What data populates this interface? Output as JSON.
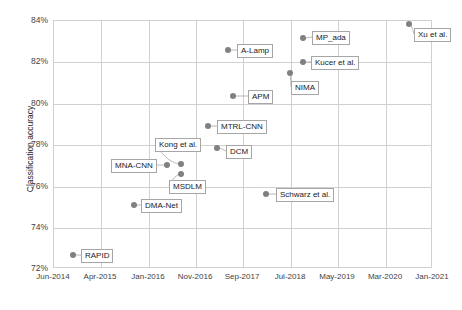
{
  "chart_data": {
    "type": "scatter",
    "title": "",
    "xlabel": "",
    "ylabel": "Classification accuracy",
    "xtick_labels": [
      "Jun-2014",
      "Apr-2015",
      "Jan-2016",
      "Nov-2016",
      "Sep-2017",
      "Jul-2018",
      "May-2019",
      "Mar-2020",
      "Jan-2021"
    ],
    "ytick_labels": [
      "84%",
      "82%",
      "80%",
      "78%",
      "76%",
      "74%",
      "72%"
    ],
    "ylim": [
      72,
      84
    ],
    "ytick_values": [
      84,
      82,
      80,
      78,
      76,
      74,
      72
    ],
    "grid": true,
    "legend": "none",
    "marker_color": "#808080",
    "points": [
      {
        "label": "RAPID",
        "x_pct": 5.3,
        "y": 72.85,
        "date": "Oct-2014"
      },
      {
        "label": "DMA-Net",
        "x_pct": 21.4,
        "y": 75.3,
        "date": "Mar-2016"
      },
      {
        "label": "MNA-CNN",
        "x_pct": 30.1,
        "y": 77.25,
        "date": "Jan-2017"
      },
      {
        "label": "Kong et al.",
        "x_pct": 33.8,
        "y": 77.3,
        "date": "May-2017"
      },
      {
        "label": "MSDLM",
        "x_pct": 33.8,
        "y": 76.8,
        "date": "May-2017"
      },
      {
        "label": "MTRL-CNN",
        "x_pct": 40.9,
        "y": 79.15,
        "date": "Dec-2017"
      },
      {
        "label": "DCM",
        "x_pct": 43.3,
        "y": 78.05,
        "date": "Mar-2018"
      },
      {
        "label": "A-Lamp",
        "x_pct": 46.2,
        "y": 82.8,
        "date": "Jun-2018"
      },
      {
        "label": "APM",
        "x_pct": 47.5,
        "y": 80.55,
        "date": "Jul-2018"
      },
      {
        "label": "Schwarz et al.",
        "x_pct": 56.2,
        "y": 75.8,
        "date": "Apr-2019"
      },
      {
        "label": "NIMA",
        "x_pct": 62.5,
        "y": 81.65,
        "date": "Nov-2019"
      },
      {
        "label": "Kucer et al.",
        "x_pct": 65.9,
        "y": 82.2,
        "date": "Mar-2020"
      },
      {
        "label": "MP_ada",
        "x_pct": 65.9,
        "y": 83.35,
        "date": "Mar-2020"
      },
      {
        "label": "Xu et al.",
        "x_pct": 93.9,
        "y": 84.0,
        "date": "Dec-2020"
      }
    ],
    "markers": [
      {
        "name": "rapid",
        "cx": 73,
        "cy": 255
      },
      {
        "name": "dma-net",
        "cx": 134,
        "cy": 205
      },
      {
        "name": "mna-cnn",
        "cx": 167,
        "cy": 165
      },
      {
        "name": "kong-et-al",
        "cx": 181,
        "cy": 164
      },
      {
        "name": "msdlm",
        "cx": 181,
        "cy": 174
      },
      {
        "name": "mtrl-cnn",
        "cx": 208,
        "cy": 126
      },
      {
        "name": "dcm",
        "cx": 217,
        "cy": 148
      },
      {
        "name": "a-lamp",
        "cx": 228,
        "cy": 50
      },
      {
        "name": "apm",
        "cx": 233,
        "cy": 96
      },
      {
        "name": "schwarz-et-al",
        "cx": 266,
        "cy": 194
      },
      {
        "name": "nima",
        "cx": 290,
        "cy": 73
      },
      {
        "name": "kucer-et-al",
        "cx": 303,
        "cy": 62
      },
      {
        "name": "mp-ada",
        "cx": 303,
        "cy": 38
      },
      {
        "name": "xu-et-al",
        "cx": 409,
        "cy": 24
      }
    ],
    "labels": [
      {
        "name": "rapid",
        "text": "RAPID",
        "left": 81,
        "top": 249
      },
      {
        "name": "dma-net",
        "text": "DMA-Net",
        "left": 141,
        "top": 199
      },
      {
        "name": "mna-cnn",
        "text": "MNA-CNN",
        "left": 111,
        "top": 159
      },
      {
        "name": "kong-et-al",
        "text": "Kong et al.",
        "left": 155,
        "top": 138
      },
      {
        "name": "msdlm",
        "text": "MSDLM",
        "left": 169,
        "top": 180
      },
      {
        "name": "mtrl-cnn",
        "text": "MTRL-CNN",
        "left": 217,
        "top": 120
      },
      {
        "name": "dcm",
        "text": "DCM",
        "left": 226,
        "top": 145
      },
      {
        "name": "a-lamp",
        "text": "A-Lamp",
        "left": 237,
        "top": 44
      },
      {
        "name": "apm",
        "text": "APM",
        "left": 248,
        "top": 90
      },
      {
        "name": "schwarz-et-al",
        "text": "Schwarz et al.",
        "left": 276,
        "top": 188
      },
      {
        "name": "nima",
        "text": "NIMA",
        "left": 291,
        "top": 81
      },
      {
        "name": "kucer-et-al",
        "text": "Kucer et al.",
        "left": 311,
        "top": 56
      },
      {
        "name": "mp-ada",
        "text": "MP_ada",
        "left": 312,
        "top": 31
      },
      {
        "name": "xu-et-al",
        "text": "Xu et al.",
        "left": 414,
        "top": 28
      }
    ],
    "gridlines_y": [
      20,
      61,
      103,
      144,
      186,
      227,
      268
    ],
    "gridlines_x": [
      53,
      100,
      148,
      195,
      242,
      290,
      337,
      385,
      432
    ]
  }
}
